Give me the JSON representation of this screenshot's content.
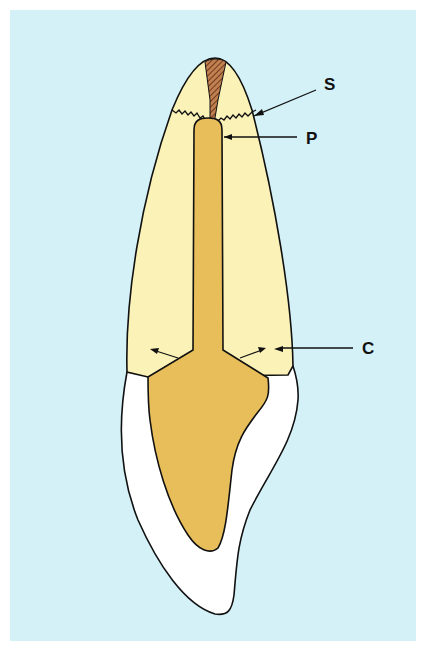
{
  "figure": {
    "colors": {
      "background": "#d4f1f8",
      "page": "#ffffff",
      "crown_dentin": "#fbf2b8",
      "pulp": "#e8be5a",
      "root_enamel": "#ffffff",
      "hatched_area": "#9a5a35",
      "outline": "#111111"
    },
    "labels": [
      {
        "id": "S",
        "text": "S"
      },
      {
        "id": "P",
        "text": "P"
      },
      {
        "id": "C",
        "text": "C"
      }
    ]
  }
}
